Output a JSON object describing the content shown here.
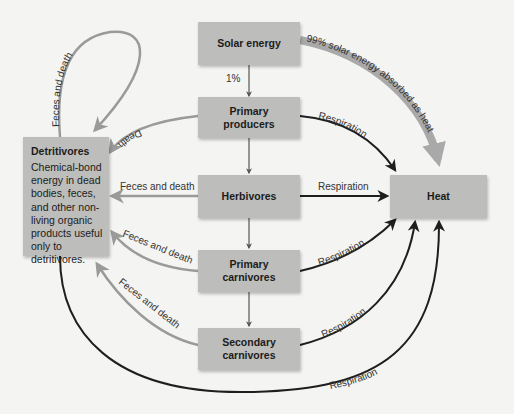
{
  "diagram": {
    "nodes": {
      "solar": {
        "label": "Solar energy"
      },
      "producers": {
        "label": "Primary\nproducers"
      },
      "herbivores": {
        "label": "Herbivores"
      },
      "primary_carnivores": {
        "label": "Primary\ncarnivores"
      },
      "secondary_carnivores": {
        "label": "Secondary\ncarnivores"
      },
      "heat": {
        "label": "Heat"
      },
      "detritivores": {
        "title": "Detritivores",
        "description": "Chemical-bond\nenergy in dead\nbodies, feces,\nand other non-\nliving organic\nproducts useful\nonly to\ndetritivores."
      }
    },
    "edges": {
      "solar_to_producers": "1%",
      "solar_to_heat": "99% solar energy absorbed as heat",
      "producers_to_heat": "Respiration",
      "herbivores_to_heat": "Respiration",
      "primary_carnivores_to_heat": "Respiration",
      "secondary_carnivores_to_heat": "Respiration",
      "detritivores_to_heat": "Respiration",
      "producers_to_detritivores": "Death",
      "herbivores_to_detritivores": "Feces and death",
      "primary_carnivores_to_detritivores": "Feces and death",
      "secondary_carnivores_to_detritivores": "Feces and death",
      "detritivores_loop": "Feces and death"
    },
    "colors": {
      "background": "#f4f4f2",
      "box": "#bdbdbb",
      "gray_arrow": "#9a9a9a",
      "dark_arrow": "#1e1e1e",
      "solar_heat_arrow": "#a9a9a9"
    }
  }
}
